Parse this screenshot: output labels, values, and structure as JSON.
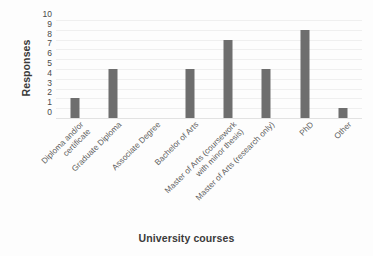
{
  "chart_data": {
    "type": "bar",
    "title": "",
    "xlabel": "University courses",
    "ylabel": "Responses",
    "categories": [
      "Diploma and/or\ncertificate",
      "Graduate Diploma",
      "Associate Degree",
      "Bachelor of Arts",
      "Master of Arts (coursework\nwith minor thesis)",
      "Master of Arts (research only)",
      "PhD",
      "Other"
    ],
    "values": [
      2,
      5,
      0,
      5,
      8,
      5,
      9,
      1
    ],
    "ylim": [
      0,
      10
    ],
    "yticks": [
      "10",
      "9",
      "8",
      "7",
      "6",
      "5",
      "4",
      "3",
      "2",
      "1",
      "0"
    ],
    "grid": true,
    "legend": false,
    "bar_color": "#6e6e6e",
    "grid_color": "#efefef",
    "background": "#ffffff"
  }
}
